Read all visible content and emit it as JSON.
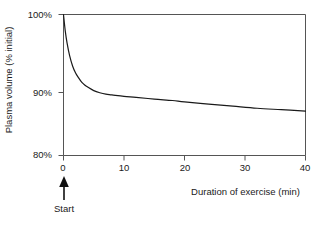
{
  "chart_data": {
    "type": "line",
    "title": "",
    "subtitle": "",
    "xlabel": "Duration of exercise (min)",
    "ylabel": "Plasma volume (% initial)",
    "xlim": [
      0,
      40
    ],
    "ylim": [
      80,
      100
    ],
    "xticks": [
      0,
      10,
      20,
      30,
      40
    ],
    "xtick_labels": [
      "0",
      "10",
      "20",
      "30",
      "40"
    ],
    "yticks": [
      80,
      90,
      100
    ],
    "ytick_labels": [
      "80%",
      "90%",
      "100%"
    ],
    "grid": false,
    "legend": null,
    "line_color": "#1a1a1a",
    "axis_color": "#4d4d4d",
    "series": [
      {
        "name": "Plasma volume",
        "x": [
          0,
          0.3,
          0.6,
          1,
          1.5,
          2,
          2.5,
          3,
          3.5,
          4,
          5,
          6,
          7,
          8,
          10,
          12,
          15,
          18,
          20,
          24,
          28,
          32,
          36,
          40
        ],
        "y": [
          100,
          97.6,
          95.9,
          94.2,
          92.7,
          91.7,
          91.0,
          90.4,
          90.0,
          89.7,
          89.2,
          88.9,
          88.7,
          88.6,
          88.4,
          88.25,
          88.0,
          87.8,
          87.6,
          87.3,
          87.0,
          86.7,
          86.5,
          86.3
        ]
      }
    ],
    "annotations": [
      {
        "name": "start-arrow",
        "label": "Start",
        "x": 0,
        "points_to": "x-axis-origin"
      }
    ]
  }
}
